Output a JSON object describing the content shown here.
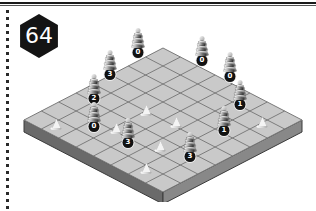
{
  "page": {
    "badge_number": "64",
    "background_color": "#ffffff"
  },
  "board": {
    "name": "isometric-8x8-board",
    "rows": 8,
    "cols": 8,
    "top_color": "#c9c9c9",
    "edge_color": "#5b5b5b",
    "grid_line_color": "#6e6e6e"
  },
  "legend": {
    "tower_badge_color": "#121212",
    "tower_badge_text_color": "#ffffff",
    "pawn_color": "#f4f4f4"
  },
  "pieces": [
    {
      "id": "tower-a",
      "type": "tower",
      "label": "0",
      "x": 120,
      "y": 26,
      "rings": 6
    },
    {
      "id": "tower-b",
      "type": "tower",
      "label": "0",
      "x": 184,
      "y": 34,
      "rings": 6
    },
    {
      "id": "tower-c",
      "type": "tower",
      "label": "0",
      "x": 212,
      "y": 50,
      "rings": 6
    },
    {
      "id": "tower-d",
      "type": "tower",
      "label": "3",
      "x": 92,
      "y": 48,
      "rings": 6
    },
    {
      "id": "tower-e",
      "type": "tower",
      "label": "2",
      "x": 76,
      "y": 72,
      "rings": 6
    },
    {
      "id": "tower-f",
      "type": "tower",
      "label": "1",
      "x": 222,
      "y": 78,
      "rings": 6
    },
    {
      "id": "tower-g",
      "type": "tower",
      "label": "0",
      "x": 76,
      "y": 100,
      "rings": 6
    },
    {
      "id": "tower-h",
      "type": "tower",
      "label": "1",
      "x": 206,
      "y": 104,
      "rings": 6
    },
    {
      "id": "tower-i",
      "type": "tower",
      "label": "3",
      "x": 110,
      "y": 116,
      "rings": 6
    },
    {
      "id": "tower-j",
      "type": "tower",
      "label": "3",
      "x": 172,
      "y": 130,
      "rings": 6
    },
    {
      "id": "pawn-a",
      "type": "pawn",
      "x": 38,
      "y": 98
    },
    {
      "id": "pawn-b",
      "type": "pawn",
      "x": 128,
      "y": 84
    },
    {
      "id": "pawn-c",
      "type": "pawn",
      "x": 158,
      "y": 96
    },
    {
      "id": "pawn-d",
      "type": "pawn",
      "x": 98,
      "y": 102
    },
    {
      "id": "pawn-e",
      "type": "pawn",
      "x": 142,
      "y": 120
    },
    {
      "id": "pawn-f",
      "type": "pawn",
      "x": 244,
      "y": 96
    },
    {
      "id": "pawn-g",
      "type": "pawn",
      "x": 128,
      "y": 142
    }
  ]
}
